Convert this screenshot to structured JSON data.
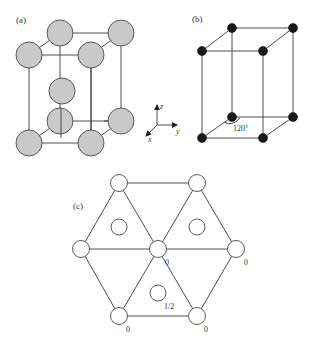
{
  "panels": {
    "a": {
      "label": "(a)",
      "description": "HCP unit cell with shaded atoms",
      "atoms": [
        {
          "name": "top-back-left",
          "cx": 60,
          "cy": 33
        },
        {
          "name": "top-back-right",
          "cx": 121,
          "cy": 33
        },
        {
          "name": "top-front-left",
          "cx": 29,
          "cy": 55
        },
        {
          "name": "top-front-right",
          "cx": 91,
          "cy": 55
        },
        {
          "name": "middle",
          "cx": 62,
          "cy": 91
        },
        {
          "name": "bottom-back-left",
          "cx": 60,
          "cy": 121
        },
        {
          "name": "bottom-back-right",
          "cx": 121,
          "cy": 121
        },
        {
          "name": "bottom-front-left",
          "cx": 29,
          "cy": 143
        },
        {
          "name": "bottom-front-right",
          "cx": 91,
          "cy": 143
        }
      ]
    },
    "axes": {
      "z_label": "z",
      "y_label": "y",
      "x_label": "x"
    },
    "b": {
      "label": "(b)",
      "angle_label": "120°",
      "description": "Hexagonal primitive cell with black lattice points"
    },
    "c": {
      "label": "(c)",
      "description": "Basal plane projection with atom heights",
      "height_labels": {
        "center": "0",
        "right": "0",
        "bottom_left": "0",
        "bottom_right": "0",
        "inner_bottom": "1/2"
      }
    }
  },
  "colors": {
    "atom_shaded": "#c9c9c9",
    "atom_black": "#1a1a1a",
    "line": "#3a3a3a"
  }
}
